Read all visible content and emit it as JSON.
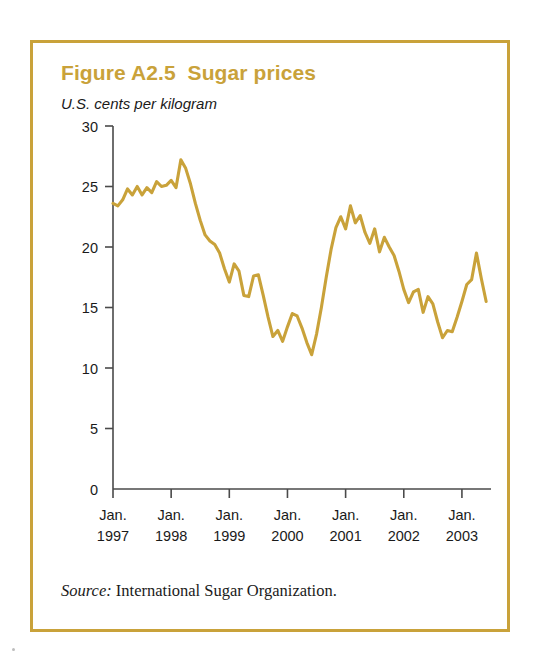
{
  "figure": {
    "title": "Figure A2.5  Sugar prices",
    "subtitle": "U.S. cents per kilogram",
    "source_label": "Source:",
    "source_text": " International Sugar Organization."
  },
  "colors": {
    "frame": "#c9a23a",
    "title": "#c9a23a",
    "line": "#c9a23a",
    "axis": "#4a4a4a",
    "text": "#1a1a1a",
    "background": "#ffffff"
  },
  "chart_data": {
    "type": "line",
    "title": "Figure A2.5  Sugar prices",
    "subtitle": "U.S. cents per kilogram",
    "xlabel": "",
    "ylabel": "U.S. cents per kilogram",
    "ylim": [
      0,
      30
    ],
    "yticks": [
      0,
      5,
      10,
      15,
      20,
      25,
      30
    ],
    "ytick_labels": [
      "0",
      "5",
      "10",
      "15",
      "20",
      "25",
      "30"
    ],
    "xtick_labels": [
      [
        "Jan.",
        "1997"
      ],
      [
        "Jan.",
        "1998"
      ],
      [
        "Jan.",
        "1999"
      ],
      [
        "Jan.",
        "2000"
      ],
      [
        "Jan.",
        "2001"
      ],
      [
        "Jan.",
        "2002"
      ],
      [
        "Jan.",
        "2003"
      ]
    ],
    "xtick_positions": [
      0,
      12,
      24,
      36,
      48,
      60,
      72
    ],
    "xlim": [
      0,
      78
    ],
    "grid": false,
    "legend": false,
    "series": [
      {
        "name": "Sugar price (U.S. cents per kilogram)",
        "x": [
          0,
          1,
          2,
          3,
          4,
          5,
          6,
          7,
          8,
          9,
          10,
          11,
          12,
          13,
          14,
          15,
          16,
          17,
          18,
          19,
          20,
          21,
          22,
          23,
          24,
          25,
          26,
          27,
          28,
          29,
          30,
          31,
          32,
          33,
          34,
          35,
          36,
          37,
          38,
          39,
          40,
          41,
          42,
          43,
          44,
          45,
          46,
          47,
          48,
          49,
          50,
          51,
          52,
          53,
          54,
          55,
          56,
          57,
          58,
          59,
          60,
          61,
          62,
          63,
          64,
          65,
          66,
          67,
          68,
          69,
          70,
          71,
          72,
          73,
          74,
          75,
          76,
          77
        ],
        "values": [
          23.6,
          23.4,
          23.9,
          24.8,
          24.3,
          25.0,
          24.3,
          24.9,
          24.5,
          25.4,
          25.0,
          25.1,
          25.5,
          24.9,
          27.2,
          26.5,
          25.2,
          23.6,
          22.2,
          21.0,
          20.5,
          20.2,
          19.5,
          18.2,
          17.1,
          18.6,
          18.0,
          16.0,
          15.9,
          17.6,
          17.7,
          16.0,
          14.2,
          12.6,
          13.1,
          12.2,
          13.4,
          14.5,
          14.3,
          13.3,
          12.1,
          11.1,
          12.8,
          15.0,
          17.5,
          19.8,
          21.6,
          22.5,
          21.5,
          23.4,
          22.0,
          22.6,
          21.2,
          20.3,
          21.5,
          19.6,
          20.8,
          20.0,
          19.3,
          18.0,
          16.5,
          15.4,
          16.3,
          16.5,
          14.6,
          15.9,
          15.3,
          13.8,
          12.5,
          13.1,
          13.0,
          14.2,
          15.5,
          16.9,
          17.3,
          19.5,
          17.4,
          15.5
        ]
      }
    ]
  },
  "axis": {
    "y_tick_names": [
      "y-tick-0",
      "y-tick-5",
      "y-tick-10",
      "y-tick-15",
      "y-tick-20",
      "y-tick-25",
      "y-tick-30"
    ]
  }
}
